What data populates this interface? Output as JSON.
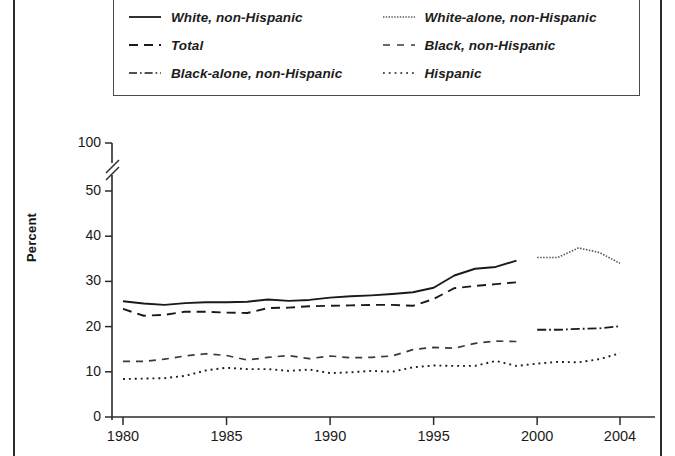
{
  "figure": {
    "y_axis_title": "Percent",
    "y_ticks": [
      "0",
      "10",
      "20",
      "30",
      "40",
      "50",
      "100"
    ],
    "x_ticks": [
      "1980",
      "1985",
      "1990",
      "1995",
      "2000",
      "2004"
    ],
    "axis_break": true
  },
  "legend": {
    "items": [
      {
        "label": "White, non-Hispanic",
        "style": "solid"
      },
      {
        "label": "White-alone, non-Hispanic",
        "style": "fine-dotted"
      },
      {
        "label": "Total",
        "style": "dashed"
      },
      {
        "label": "Black, non-Hispanic",
        "style": "long-dashed"
      },
      {
        "label": "Black-alone, non-Hispanic",
        "style": "dash-dot"
      },
      {
        "label": "Hispanic",
        "style": "dotted"
      }
    ]
  },
  "chart_data": {
    "type": "line",
    "title": "",
    "xlabel": "",
    "ylabel": "Percent",
    "xlim": [
      1980,
      2004
    ],
    "ylim": [
      0,
      50
    ],
    "y_break_note": "Axis broken between 50 and 100",
    "grid": false,
    "legend_position": "top",
    "x": [
      1980,
      1981,
      1982,
      1983,
      1984,
      1985,
      1986,
      1987,
      1988,
      1989,
      1990,
      1991,
      1992,
      1993,
      1994,
      1995,
      1996,
      1997,
      1998,
      1999,
      2000,
      2001,
      2002,
      2003,
      2004
    ],
    "series": [
      {
        "name": "White, non-Hispanic",
        "style": "solid",
        "x": [
          1980,
          1981,
          1982,
          1983,
          1984,
          1985,
          1986,
          1987,
          1988,
          1989,
          1990,
          1991,
          1992,
          1993,
          1994,
          1995,
          1996,
          1997,
          1998,
          1999
        ],
        "values": [
          25.6,
          25.1,
          24.8,
          25.2,
          25.4,
          25.4,
          25.5,
          26.0,
          25.7,
          25.9,
          26.4,
          26.7,
          26.9,
          27.2,
          27.6,
          28.6,
          31.3,
          32.8,
          33.2,
          34.6
        ]
      },
      {
        "name": "White-alone, non-Hispanic",
        "style": "fine-dotted",
        "x": [
          2000,
          2001,
          2002,
          2003,
          2004
        ],
        "values": [
          35.3,
          35.3,
          37.4,
          36.4,
          34.0
        ]
      },
      {
        "name": "Total",
        "style": "dashed",
        "x": [
          1980,
          1981,
          1982,
          1983,
          1984,
          1985,
          1986,
          1987,
          1988,
          1989,
          1990,
          1991,
          1992,
          1993,
          1994,
          1995,
          1996,
          1997,
          1998,
          1999
        ],
        "values": [
          23.9,
          22.4,
          22.6,
          23.3,
          23.3,
          23.1,
          23.0,
          24.1,
          24.2,
          24.5,
          24.6,
          24.7,
          24.8,
          24.8,
          24.6,
          26.1,
          28.5,
          29.0,
          29.4,
          29.8
        ]
      },
      {
        "name": "Black-alone, non-Hispanic",
        "style": "dash-dot",
        "x": [
          2000,
          2001,
          2002,
          2003,
          2004
        ],
        "values": [
          19.3,
          19.3,
          19.5,
          19.6,
          20.1
        ]
      },
      {
        "name": "Black, non-Hispanic",
        "style": "long-dashed",
        "x": [
          1980,
          1981,
          1982,
          1983,
          1984,
          1985,
          1986,
          1987,
          1988,
          1989,
          1990,
          1991,
          1992,
          1993,
          1994,
          1995,
          1996,
          1997,
          1998,
          1999
        ],
        "values": [
          12.3,
          12.3,
          12.8,
          13.5,
          14.0,
          13.6,
          12.6,
          13.2,
          13.6,
          12.9,
          13.5,
          13.1,
          13.2,
          13.5,
          14.9,
          15.4,
          15.2,
          16.3,
          16.8,
          16.7
        ]
      },
      {
        "name": "Hispanic",
        "style": "dotted",
        "x": [
          1980,
          1981,
          1982,
          1983,
          1984,
          1985,
          1986,
          1987,
          1988,
          1989,
          1990,
          1991,
          1992,
          1993,
          1994,
          1995,
          1996,
          1997,
          1998,
          1999,
          2000,
          2001,
          2002,
          2003,
          2004
        ],
        "values": [
          8.4,
          8.5,
          8.6,
          9.1,
          10.3,
          10.9,
          10.6,
          10.6,
          10.2,
          10.5,
          9.7,
          9.9,
          10.2,
          10.0,
          11.0,
          11.4,
          11.3,
          11.3,
          12.4,
          11.3,
          11.8,
          12.2,
          12.1,
          12.8,
          14.1
        ]
      }
    ]
  }
}
